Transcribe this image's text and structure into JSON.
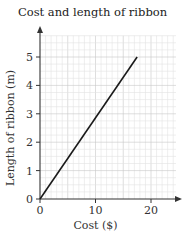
{
  "chart_data": {
    "type": "line",
    "title": "Cost and length of ribbon",
    "xlabel": "Cost ($)",
    "ylabel": "Length of ribbon (m)",
    "xlim": [
      0,
      25
    ],
    "ylim": [
      0,
      5.8
    ],
    "x_ticks": [
      0,
      10,
      20
    ],
    "y_ticks": [
      0,
      1,
      2,
      3,
      4,
      5
    ],
    "grid": true,
    "series": [
      {
        "name": "ribbon",
        "x": [
          0,
          17.5
        ],
        "y": [
          0,
          5
        ]
      }
    ],
    "colors": {
      "line": "#1a1a1a",
      "grid_minor": "#e2e2e2",
      "grid_major": "#c8c8c8",
      "axis": "#333333"
    }
  }
}
